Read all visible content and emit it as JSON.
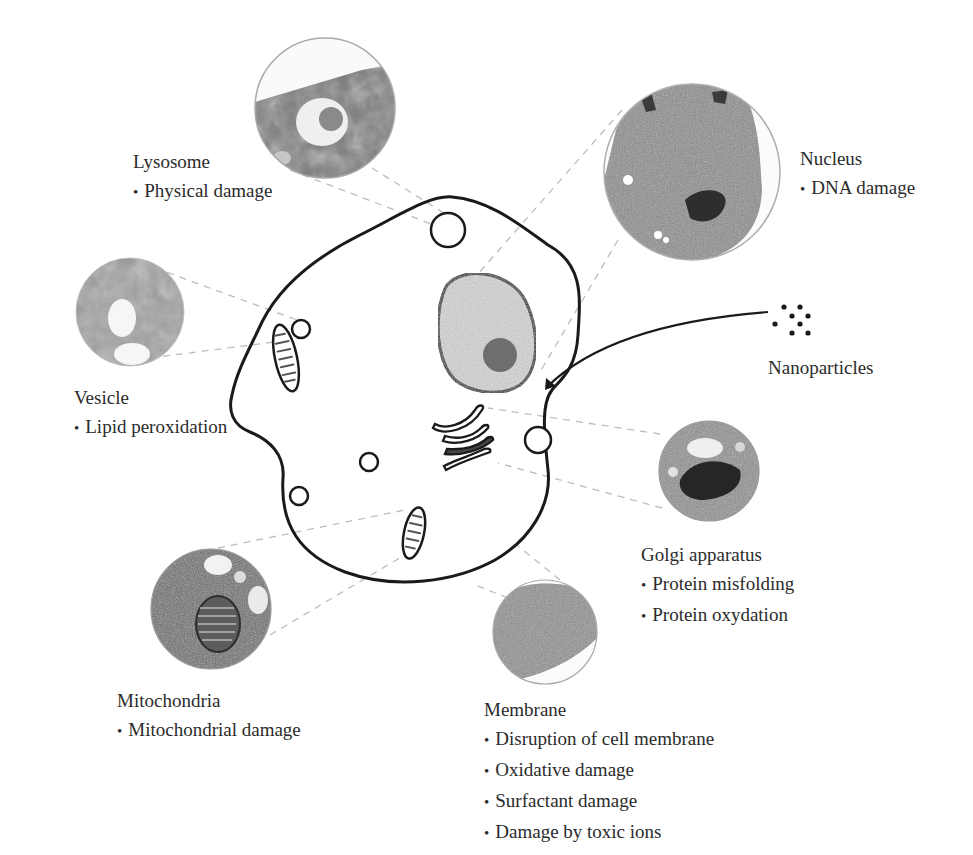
{
  "diagram": {
    "colors": {
      "outline": "#1a1a1a",
      "nucleus_fill": "#d4d4d4",
      "nucleolus_fill": "#6e6e6e",
      "leader_line": "#b8b8b8",
      "micrograph_dark": "#5a5a5a",
      "micrograph_mid": "#8c8c8c",
      "micrograph_light": "#c8c8c8"
    },
    "nanoparticles": {
      "label": "Nanoparticles",
      "dot_count": 8
    },
    "organelles": [
      {
        "id": "lysosome",
        "title": "Lysosome",
        "effects": [
          "Physical damage"
        ]
      },
      {
        "id": "nucleus",
        "title": "Nucleus",
        "effects": [
          "DNA damage"
        ]
      },
      {
        "id": "vesicle",
        "title": "Vesicle",
        "effects": [
          "Lipid peroxidation"
        ]
      },
      {
        "id": "golgi",
        "title": "Golgi apparatus",
        "effects": [
          "Protein misfolding",
          "Protein oxydation"
        ]
      },
      {
        "id": "mitochondria",
        "title": "Mitochondria",
        "effects": [
          "Mitochondrial damage"
        ]
      },
      {
        "id": "membrane",
        "title": "Membrane",
        "effects": [
          "Disruption of cell membrane",
          "Oxidative damage",
          "Surfactant damage",
          "Damage by toxic ions"
        ]
      }
    ]
  }
}
